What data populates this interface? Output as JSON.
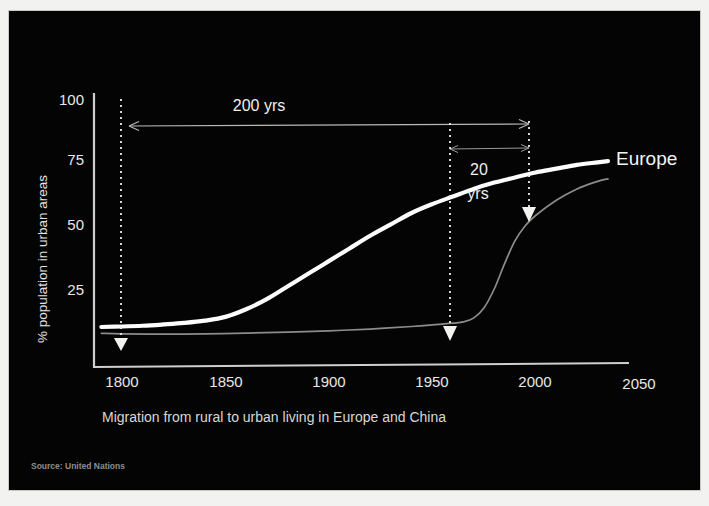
{
  "slide": {
    "background_color": "#040404",
    "frame_color": "#f2f2f0",
    "caption": "Migration from rural to urban living in Europe and China",
    "source": "Source: United Nations"
  },
  "chart_data": {
    "type": "line",
    "title": "",
    "subtitle": "",
    "xlabel": "",
    "ylabel": "% population in urban areas",
    "xlim": [
      1785,
      2050
    ],
    "ylim": [
      0,
      108
    ],
    "grid": false,
    "legend_position": "inline-right",
    "x_ticks": [
      1800,
      1850,
      1900,
      1950,
      2000,
      2050
    ],
    "x_tick_labels": [
      "1800",
      "1850",
      "1900",
      "1950",
      "2000",
      "2050"
    ],
    "y_ticks": [
      25,
      50,
      75,
      100
    ],
    "y_tick_labels": [
      "25",
      "50",
      "75",
      "100"
    ],
    "series": [
      {
        "name": "Europe",
        "label": "Europe",
        "color": "#fdfdfd",
        "width": 4.2,
        "x": [
          1790,
          1800,
          1810,
          1820,
          1830,
          1840,
          1850,
          1860,
          1870,
          1880,
          1890,
          1900,
          1910,
          1920,
          1930,
          1940,
          1950,
          1960,
          1970,
          1980,
          1990,
          2000,
          2010,
          2020,
          2030,
          2035
        ],
        "y": [
          10,
          10.2,
          10.5,
          11,
          11.6,
          12.5,
          14,
          17,
          21,
          26,
          31,
          36,
          41,
          46,
          50.5,
          55,
          58.5,
          61.5,
          64.5,
          67,
          69,
          71,
          72.5,
          74,
          75,
          75.5
        ]
      },
      {
        "name": "China",
        "label": "",
        "color": "#8c8c8a",
        "width": 1.7,
        "x": [
          1790,
          1800,
          1820,
          1840,
          1860,
          1880,
          1900,
          1920,
          1940,
          1950,
          1960,
          1965,
          1970,
          1975,
          1980,
          1985,
          1990,
          1995,
          2000,
          2010,
          2020,
          2030,
          2035
        ],
        "y": [
          7.5,
          7.3,
          7.2,
          7.3,
          7.6,
          8,
          8.5,
          9.2,
          10.2,
          10.8,
          11.5,
          12,
          13.5,
          17.5,
          25,
          35,
          44,
          50,
          54,
          60,
          64.5,
          67.5,
          68.5
        ]
      }
    ],
    "annotations": [
      {
        "name": "span-200-yrs",
        "text": "200 yrs",
        "kind": "double-arrow-horizontal",
        "from_x": 1800,
        "to_x": 2000,
        "at_y": 93
      },
      {
        "name": "span-20-yrs",
        "text": "20 yrs",
        "text_lines": [
          "20",
          "yrs"
        ],
        "kind": "double-arrow-horizontal",
        "from_x": 1960,
        "to_x": 2000,
        "at_y": 82
      },
      {
        "name": "marker-1800",
        "kind": "dotted-vertical-down-arrow",
        "at_x": 1800,
        "top_y": 102,
        "bottom_y": 10
      },
      {
        "name": "marker-1960",
        "kind": "dotted-vertical-down-arrow",
        "at_x": 1960,
        "top_y": 93,
        "bottom_y": 11
      },
      {
        "name": "marker-2000",
        "kind": "dotted-vertical-down-arrow",
        "at_x": 2000,
        "top_y": 93,
        "bottom_y": 57
      }
    ]
  }
}
